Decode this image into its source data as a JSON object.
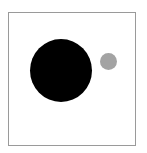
{
  "figure": {
    "frame": {
      "border_color": "#9a9a9a",
      "background": "#ffffff"
    },
    "shapes": [
      {
        "id": "large-circle",
        "type": "circle",
        "color": "#000000",
        "center": [
          60,
          70
        ],
        "diameter": 62
      },
      {
        "id": "small-circle",
        "type": "circle",
        "color": "#a3a3a3",
        "center": [
          107,
          61
        ],
        "diameter": 17
      }
    ]
  }
}
